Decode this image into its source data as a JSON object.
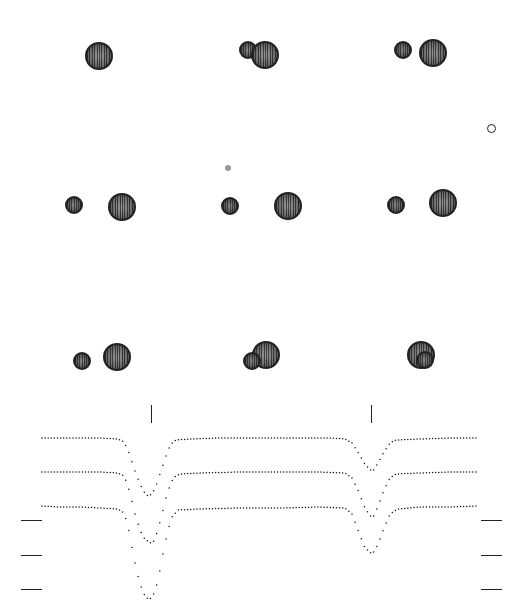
{
  "figure": {
    "title": "",
    "colors": {
      "star": "#6a6a6a",
      "outline": "#222222",
      "dot": "#999999",
      "background": "#ffffff"
    },
    "panels": [
      {
        "id": 1,
        "row": 1,
        "col": 1,
        "stars": [
          {
            "cx": 99,
            "cy": 56,
            "r": 14,
            "size": "big"
          }
        ]
      },
      {
        "id": 2,
        "row": 1,
        "col": 2,
        "stars": [
          {
            "cx": 248,
            "cy": 50,
            "r": 9,
            "size": "small",
            "layer": "back"
          },
          {
            "cx": 265,
            "cy": 55,
            "r": 14,
            "size": "big",
            "layer": "front"
          }
        ]
      },
      {
        "id": 3,
        "row": 1,
        "col": 3,
        "stars": [
          {
            "cx": 403,
            "cy": 50,
            "r": 9,
            "size": "small"
          },
          {
            "cx": 433,
            "cy": 53,
            "r": 14,
            "size": "big"
          }
        ]
      },
      {
        "id": 4,
        "row": 2,
        "col": 1,
        "stars": [
          {
            "cx": 74,
            "cy": 205,
            "r": 9,
            "size": "small"
          },
          {
            "cx": 122,
            "cy": 207,
            "r": 14,
            "size": "big"
          }
        ]
      },
      {
        "id": 5,
        "row": 2,
        "col": 2,
        "stars": [
          {
            "cx": 230,
            "cy": 206,
            "r": 9,
            "size": "small"
          },
          {
            "cx": 288,
            "cy": 206,
            "r": 14,
            "size": "big"
          }
        ]
      },
      {
        "id": 6,
        "row": 2,
        "col": 3,
        "stars": [
          {
            "cx": 396,
            "cy": 205,
            "r": 9,
            "size": "small"
          },
          {
            "cx": 443,
            "cy": 203,
            "r": 14,
            "size": "big"
          }
        ]
      },
      {
        "id": 7,
        "row": 3,
        "col": 1,
        "stars": [
          {
            "cx": 82,
            "cy": 361,
            "r": 9,
            "size": "small"
          },
          {
            "cx": 117,
            "cy": 357,
            "r": 14,
            "size": "big"
          }
        ]
      },
      {
        "id": 8,
        "row": 3,
        "col": 2,
        "stars": [
          {
            "cx": 266,
            "cy": 355,
            "r": 14,
            "size": "big",
            "layer": "back"
          },
          {
            "cx": 252,
            "cy": 361,
            "r": 9,
            "size": "small",
            "layer": "front"
          }
        ]
      },
      {
        "id": 9,
        "row": 3,
        "col": 3,
        "stars": [
          {
            "cx": 421,
            "cy": 355,
            "r": 14,
            "size": "big",
            "layer": "back"
          },
          {
            "cx": 425,
            "cy": 360,
            "r": 9,
            "size": "small",
            "layer": "front"
          }
        ]
      }
    ],
    "markers": {
      "filled_dot": {
        "x": 228,
        "y": 168,
        "r": 3
      },
      "open_circle": {
        "x": 491,
        "y": 128,
        "r": 4.5
      }
    },
    "eclipse_ticks": [
      {
        "x": 151,
        "y1": 405,
        "y2": 423
      },
      {
        "x": 371,
        "y1": 405,
        "y2": 423
      }
    ],
    "left_ticks": [
      {
        "y": 520,
        "x1": 21,
        "x2": 42
      },
      {
        "y": 555,
        "x1": 21,
        "x2": 42
      },
      {
        "y": 589,
        "x1": 21,
        "x2": 42
      }
    ],
    "right_ticks": [
      {
        "y": 520,
        "x1": 481,
        "x2": 502
      },
      {
        "y": 555,
        "x1": 481,
        "x2": 502
      },
      {
        "y": 589,
        "x1": 481,
        "x2": 502
      }
    ]
  },
  "chart_data": {
    "type": "line",
    "title": "",
    "xlabel": "",
    "ylabel": "",
    "grid": false,
    "legend": "none",
    "x_pixel_range": [
      42,
      478
    ],
    "series": [
      {
        "name": "light curve 1",
        "baseline_y": 438,
        "points": [
          [
            42,
            438
          ],
          [
            60,
            438
          ],
          [
            80,
            438
          ],
          [
            100,
            438
          ],
          [
            118,
            439
          ],
          [
            124,
            442
          ],
          [
            128,
            450
          ],
          [
            132,
            462
          ],
          [
            136,
            474
          ],
          [
            140,
            484
          ],
          [
            144,
            492
          ],
          [
            148,
            496
          ],
          [
            152,
            494
          ],
          [
            156,
            486
          ],
          [
            160,
            474
          ],
          [
            164,
            462
          ],
          [
            168,
            450
          ],
          [
            172,
            443
          ],
          [
            176,
            440
          ],
          [
            190,
            439
          ],
          [
            220,
            438
          ],
          [
            260,
            438
          ],
          [
            300,
            438
          ],
          [
            330,
            438
          ],
          [
            345,
            439
          ],
          [
            352,
            443
          ],
          [
            358,
            452
          ],
          [
            364,
            463
          ],
          [
            370,
            470
          ],
          [
            374,
            470
          ],
          [
            378,
            463
          ],
          [
            384,
            452
          ],
          [
            390,
            443
          ],
          [
            396,
            440
          ],
          [
            420,
            439
          ],
          [
            450,
            438
          ],
          [
            478,
            438
          ]
        ]
      },
      {
        "name": "light curve 2",
        "baseline_y": 472,
        "points": [
          [
            42,
            472
          ],
          [
            60,
            472
          ],
          [
            80,
            472
          ],
          [
            100,
            472
          ],
          [
            118,
            473
          ],
          [
            124,
            476
          ],
          [
            128,
            486
          ],
          [
            132,
            502
          ],
          [
            136,
            518
          ],
          [
            140,
            530
          ],
          [
            144,
            538
          ],
          [
            150,
            543
          ],
          [
            154,
            541
          ],
          [
            158,
            530
          ],
          [
            162,
            514
          ],
          [
            166,
            498
          ],
          [
            170,
            485
          ],
          [
            174,
            477
          ],
          [
            180,
            474
          ],
          [
            200,
            473
          ],
          [
            240,
            472
          ],
          [
            280,
            472
          ],
          [
            320,
            472
          ],
          [
            345,
            473
          ],
          [
            352,
            478
          ],
          [
            358,
            490
          ],
          [
            364,
            506
          ],
          [
            370,
            516
          ],
          [
            374,
            516
          ],
          [
            378,
            506
          ],
          [
            384,
            490
          ],
          [
            390,
            478
          ],
          [
            396,
            474
          ],
          [
            420,
            473
          ],
          [
            450,
            472
          ],
          [
            478,
            472
          ]
        ]
      },
      {
        "name": "light curve 3",
        "baseline_y": 506,
        "points": [
          [
            42,
            506
          ],
          [
            60,
            507
          ],
          [
            80,
            507
          ],
          [
            100,
            508
          ],
          [
            118,
            509
          ],
          [
            124,
            513
          ],
          [
            128,
            526
          ],
          [
            132,
            548
          ],
          [
            136,
            568
          ],
          [
            140,
            584
          ],
          [
            144,
            594
          ],
          [
            148,
            599
          ],
          [
            152,
            598
          ],
          [
            156,
            588
          ],
          [
            160,
            570
          ],
          [
            164,
            548
          ],
          [
            168,
            530
          ],
          [
            172,
            517
          ],
          [
            178,
            510
          ],
          [
            200,
            509
          ],
          [
            240,
            508
          ],
          [
            280,
            508
          ],
          [
            320,
            507
          ],
          [
            345,
            508
          ],
          [
            352,
            514
          ],
          [
            358,
            530
          ],
          [
            364,
            546
          ],
          [
            370,
            553
          ],
          [
            374,
            552
          ],
          [
            378,
            544
          ],
          [
            384,
            528
          ],
          [
            390,
            514
          ],
          [
            398,
            509
          ],
          [
            420,
            507
          ],
          [
            450,
            507
          ],
          [
            478,
            506
          ]
        ]
      }
    ]
  }
}
